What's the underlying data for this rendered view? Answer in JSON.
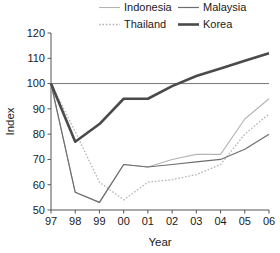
{
  "chart_data": {
    "type": "line",
    "title": "",
    "xlabel": "Year",
    "ylabel": "Index",
    "x": [
      "97",
      "98",
      "99",
      "00",
      "01",
      "02",
      "03",
      "04",
      "05",
      "06"
    ],
    "xtick_labels": [
      "97",
      "98",
      "99",
      "00",
      "01",
      "02",
      "03",
      "04",
      "05",
      "06"
    ],
    "ytick_labels": [
      "50",
      "60",
      "70",
      "80",
      "90",
      "100",
      "110",
      "120"
    ],
    "yticks": [
      50,
      60,
      70,
      80,
      90,
      100,
      110,
      120
    ],
    "ylim": [
      50,
      120
    ],
    "grid": false,
    "legend_position": "top",
    "reference_line": {
      "value": 100,
      "label": ""
    },
    "series": [
      {
        "name": "Indonesia",
        "style": "thin-solid",
        "color": "#b4b4b4",
        "width": 1.1,
        "dash": "none",
        "values": [
          100,
          57,
          53,
          68,
          67,
          70,
          72,
          72,
          86,
          94
        ]
      },
      {
        "name": "Thailand",
        "style": "dotted",
        "color": "#b4b4b4",
        "width": 1.3,
        "dash": "1.6,1.8",
        "values": [
          100,
          81,
          61,
          54,
          61,
          62,
          64,
          68,
          80,
          88
        ]
      },
      {
        "name": "Malaysia",
        "style": "medium-solid",
        "color": "#6e6e6e",
        "width": 1.2,
        "dash": "none",
        "values": [
          100,
          57,
          53,
          68,
          67,
          68,
          69,
          70,
          74,
          80
        ]
      },
      {
        "name": "Korea",
        "style": "thick-solid",
        "color": "#4a4a4a",
        "width": 2.6,
        "dash": "none",
        "values": [
          100,
          77,
          84,
          94,
          94,
          99,
          103,
          106,
          109,
          112
        ]
      }
    ]
  },
  "legend": {
    "entries": [
      {
        "label": "Indonesia"
      },
      {
        "label": "Malaysia"
      },
      {
        "label": "Thailand"
      },
      {
        "label": "Korea"
      }
    ]
  },
  "axes": {
    "y_title": "Index",
    "x_title": "Year"
  }
}
